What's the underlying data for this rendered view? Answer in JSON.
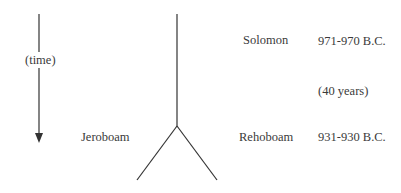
{
  "time_axis": {
    "label": "(time)",
    "direction": "down"
  },
  "tree": {
    "root": {
      "name": "Solomon",
      "date": "971-970 B.C."
    },
    "duration": "(40 years)",
    "split": {
      "left": {
        "name": "Jeroboam"
      },
      "right": {
        "name": "Rehoboam",
        "date": "931-930 B.C."
      }
    }
  },
  "colors": {
    "line": "#333333",
    "text": "#3a3a3a",
    "background": "#ffffff"
  }
}
